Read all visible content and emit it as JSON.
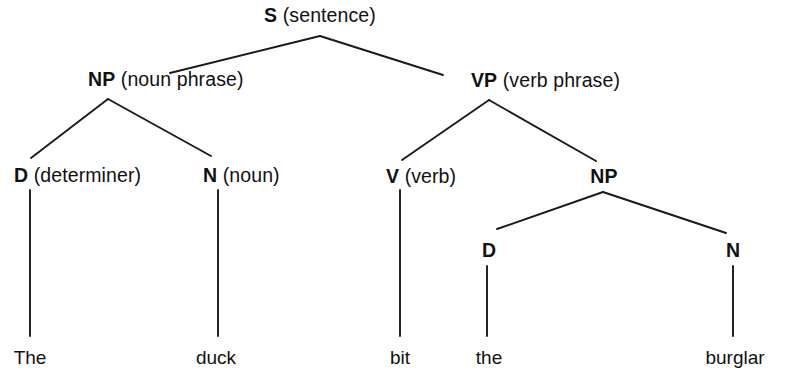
{
  "diagram": {
    "type": "syntax-tree",
    "sentence": "The duck bit the burglar",
    "stroke_color": "#1a1a1a",
    "text_color": "#111111",
    "background_color": "#ffffff",
    "nodes": {
      "s": {
        "category": "S",
        "gloss": " (sentence)"
      },
      "np_subject": {
        "category": "NP",
        "gloss": " (noun phrase)"
      },
      "vp": {
        "category": "VP",
        "gloss": " (verb phrase)"
      },
      "d_subject": {
        "category": "D",
        "gloss": " (determiner)"
      },
      "n_subject": {
        "category": "N",
        "gloss": " (noun)"
      },
      "v": {
        "category": "V",
        "gloss": " (verb)"
      },
      "np_object": {
        "category": "NP",
        "gloss": ""
      },
      "d_object": {
        "category": "D",
        "gloss": ""
      },
      "n_object": {
        "category": "N",
        "gloss": ""
      }
    },
    "terminals": {
      "the_subject": "The",
      "duck": "duck",
      "bit": "bit",
      "the_object": "the",
      "burglar": "burglar"
    }
  }
}
